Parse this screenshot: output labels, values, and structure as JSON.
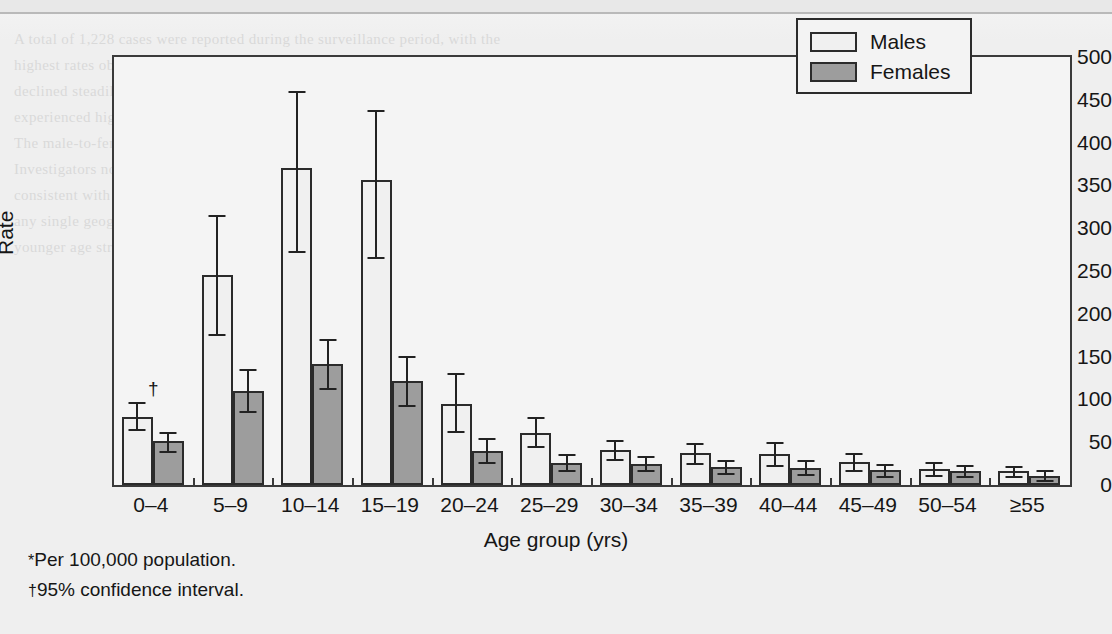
{
  "page": {
    "ghost_text": "A total of 1,228 cases were reported during the surveillance period, with the\nhighest rates observed among school-aged children and adolescents. Rates\ndeclined steadily with increasing age in both sexes, and males consistently\nexperienced higher rates than females across every age group examined.\nThe male-to-female rate ratio was greatest in the 15-19 year age group.\nInvestigators noted that the seasonal distribution of reported cases was\nconsistent with previous years, and that no clustering was identified in\nany single geographic region. Confidence intervals were wider for the\nyounger age strata because of the smaller denominators available."
  },
  "chart_data": {
    "type": "bar",
    "title": "",
    "xlabel": "Age group (yrs)",
    "ylabel": "Rate",
    "ylim": [
      0,
      500
    ],
    "yticks": [
      0,
      50,
      100,
      150,
      200,
      250,
      300,
      350,
      400,
      450,
      500
    ],
    "grid": false,
    "legend_position": "top-right",
    "categories": [
      "0–4",
      "5–9",
      "10–14",
      "15–19",
      "20–24",
      "25–29",
      "30–34",
      "35–39",
      "40–44",
      "45–49",
      "50–54",
      "≥55"
    ],
    "series": [
      {
        "name": "Males",
        "color": "#f0f0f0",
        "values": [
          80,
          245,
          370,
          356,
          95,
          61,
          41,
          37,
          36,
          27,
          19,
          16
        ],
        "ci_low": [
          65,
          176,
          273,
          266,
          63,
          45,
          30,
          26,
          23,
          18,
          12,
          10
        ],
        "ci_high": [
          97,
          315,
          460,
          438,
          131,
          80,
          53,
          49,
          50,
          37,
          27,
          22
        ]
      },
      {
        "name": "Females",
        "color": "#9d9d9d",
        "values": [
          51,
          110,
          141,
          122,
          40,
          26,
          25,
          21,
          20,
          17,
          16,
          11
        ],
        "ci_low": [
          40,
          87,
          113,
          94,
          27,
          17,
          17,
          14,
          13,
          11,
          10,
          6
        ],
        "ci_high": [
          62,
          135,
          171,
          151,
          55,
          36,
          34,
          29,
          29,
          24,
          23,
          17
        ]
      }
    ],
    "annotations": [
      {
        "name": "ci-dagger",
        "symbol": "†",
        "category": "0–4",
        "series": "Males"
      }
    ]
  },
  "legend": {
    "items": [
      {
        "label": "Males"
      },
      {
        "label": "Females"
      }
    ]
  },
  "footnotes": [
    {
      "symbol": "*",
      "text": "Per 100,000 population."
    },
    {
      "symbol": "†",
      "text": "95% confidence interval."
    }
  ]
}
